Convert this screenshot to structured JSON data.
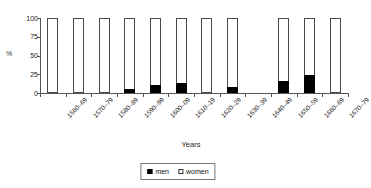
{
  "chart_data": {
    "type": "bar",
    "stacked": true,
    "title": "",
    "xlabel": "Years",
    "ylabel": "%",
    "ylim": [
      0,
      100
    ],
    "yticks": [
      0,
      25,
      50,
      75,
      100
    ],
    "grid": false,
    "legend_position": "bottom-center",
    "categories": [
      "1560–69",
      "1570–79",
      "1580–89",
      "1590–99",
      "1600–09",
      "1610–19",
      "1620–29",
      "1630–39",
      "1640–49",
      "1650–59",
      "1660–69",
      "1670–79"
    ],
    "missing_categories": [
      "1640–49"
    ],
    "series": [
      {
        "name": "men",
        "color": "#000000",
        "values": [
          0,
          0,
          0,
          5,
          11,
          14,
          0,
          8,
          null,
          16,
          24,
          0
        ]
      },
      {
        "name": "women",
        "color": "#ffffff",
        "values": [
          100,
          100,
          100,
          95,
          89,
          86,
          100,
          92,
          null,
          84,
          76,
          100
        ]
      }
    ]
  },
  "axes": {
    "y_title": "%",
    "x_title": "Years",
    "y_tick_labels": [
      "100",
      "75",
      "50",
      "25",
      "0"
    ]
  },
  "legend": {
    "items": [
      {
        "label": "men",
        "swatch": "black-square-icon"
      },
      {
        "label": "women",
        "swatch": "white-square-icon"
      }
    ]
  }
}
